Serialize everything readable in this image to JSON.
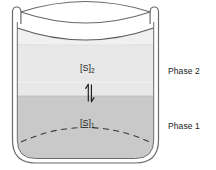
{
  "figure": {
    "name": "two-phase-partition-beaker",
    "background_color": "#ffffff"
  },
  "beaker": {
    "glass_stroke_color": "#6b6b6b",
    "glass_fill_color": "#ffffff",
    "rim_label": "beaker-rim",
    "surface_fill_color": "#f1f1f1",
    "dashed_line_color": "#3a3a3a"
  },
  "phases": {
    "upper": {
      "label": "Phase 2",
      "fill_color": "#e8e8e8",
      "species_symbol": "[S]",
      "species_subscript": "2"
    },
    "lower": {
      "label": "Phase 1",
      "fill_color": "#c9c9c9",
      "species_symbol": "[S]",
      "species_subscript": "1"
    }
  },
  "equilibrium": {
    "name": "equilibrium-arrows",
    "glyph": "⇌",
    "orientation": "vertical",
    "color": "#1a1a1a"
  }
}
